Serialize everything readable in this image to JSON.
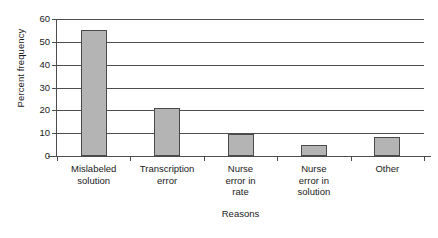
{
  "chart_data": {
    "type": "bar",
    "title": "",
    "xlabel": "Reasons",
    "ylabel": "Percent frequency",
    "categories": [
      "Mislabeled solution",
      "Transcription error",
      "Nurse error in rate",
      "Nurse error in solution",
      "Other"
    ],
    "category_lines": [
      [
        "Mislabeled",
        "solution"
      ],
      [
        "Transcription",
        "error"
      ],
      [
        "Nurse",
        "error in",
        "rate"
      ],
      [
        "Nurse",
        "error in",
        "solution"
      ],
      [
        "Other"
      ]
    ],
    "values": [
      55,
      21,
      9.5,
      5,
      8.5
    ],
    "ylim": [
      0,
      60
    ],
    "yticks": [
      0,
      10,
      20,
      30,
      40,
      50,
      60
    ],
    "ytick_labels": [
      "0",
      "10",
      "20",
      "30",
      "40",
      "50",
      "60"
    ],
    "grid": "horizontal",
    "legend": "none",
    "bar_fill_color": "#b4b4b4",
    "bar_edge_color": "#4a4a4a",
    "axis_color": "#4d4d4d",
    "background_color": "#ffffff"
  }
}
